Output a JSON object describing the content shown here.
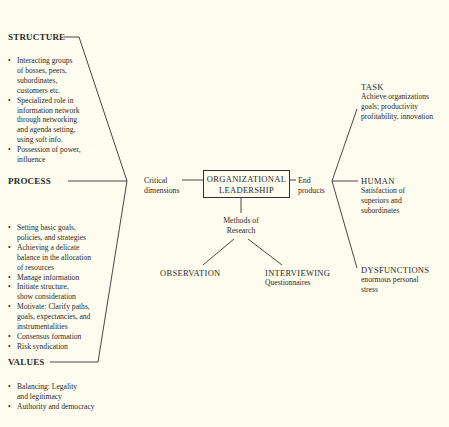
{
  "diagram": {
    "center": {
      "line1": "ORGANIZATIONAL",
      "line2": "LEADERSHIP"
    },
    "left_connector": {
      "line1": "Critical",
      "line2": "dimensions"
    },
    "right_connector": {
      "line1": "End",
      "line2": "products"
    },
    "methods": {
      "label_line1": "Methods of",
      "label_line2": "Research",
      "observation": "OBSERVATION",
      "interviewing": "INTERVIEWING",
      "interviewing_sub": "Questionnaires"
    },
    "structure": {
      "title": "STRUCTURE",
      "items": [
        [
          "Interacting groups",
          "of bosses, peers,",
          "subordinates,",
          "customers etc."
        ],
        [
          "Specialized role in",
          "information network",
          "through networking",
          "and agenda setting,",
          "using soft info."
        ],
        [
          "Possession of power,",
          "influence"
        ]
      ]
    },
    "process": {
      "title": "PROCESS",
      "items": [
        [
          "Setting basic goals,",
          "policies, and strategies"
        ],
        [
          "Achieving a delicate",
          "balance in the allocation",
          "of resources"
        ],
        [
          "Manage information"
        ],
        [
          "Initiate structure,",
          "show consideration"
        ],
        [
          "Motivate: Clarify paths,",
          "goals, expectancies, and",
          "instrumentalities"
        ],
        [
          "Consensus formation"
        ],
        [
          "Risk syndication"
        ]
      ]
    },
    "values": {
      "title": "VALUES",
      "items": [
        [
          "Balancing: Legality",
          "and legitimacy"
        ],
        [
          "Authority and democracy"
        ]
      ]
    },
    "task": {
      "title": "TASK",
      "lines": [
        "Achieve organizations",
        "goals; productivity",
        "profitability, innovation"
      ]
    },
    "human": {
      "title": "HUMAN",
      "lines": [
        "Satisfaction of",
        "superiors and",
        "subordinates"
      ]
    },
    "dysfunctions": {
      "title": "DYSFUNCTIONS",
      "lines": [
        "enormous personal",
        "stress"
      ]
    }
  }
}
